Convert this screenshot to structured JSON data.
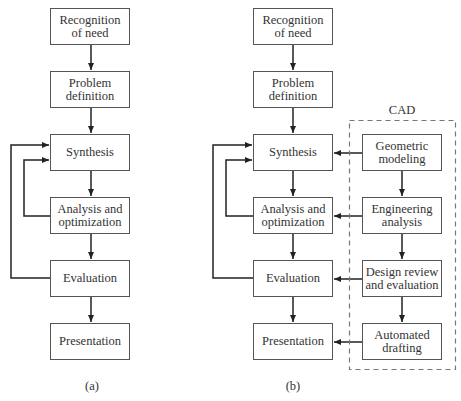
{
  "diagram_a": {
    "caption": "(a)",
    "steps": [
      {
        "id": "recognition",
        "label": "Recognition\nof need"
      },
      {
        "id": "problem",
        "label": "Problem\ndefinition"
      },
      {
        "id": "synthesis",
        "label": "Synthesis"
      },
      {
        "id": "analysis",
        "label": "Analysis and\noptimization"
      },
      {
        "id": "evaluation",
        "label": "Evaluation"
      },
      {
        "id": "presentation",
        "label": "Presentation"
      }
    ],
    "feedback_loops": [
      {
        "from": "analysis",
        "to": "synthesis"
      },
      {
        "from": "evaluation",
        "to": "synthesis"
      }
    ]
  },
  "diagram_b": {
    "caption": "(b)",
    "steps": [
      {
        "id": "recognition",
        "label": "Recognition\nof need"
      },
      {
        "id": "problem",
        "label": "Problem\ndefinition"
      },
      {
        "id": "synthesis",
        "label": "Synthesis"
      },
      {
        "id": "analysis",
        "label": "Analysis and\noptimization"
      },
      {
        "id": "evaluation",
        "label": "Evaluation"
      },
      {
        "id": "presentation",
        "label": "Presentation"
      }
    ],
    "cad_group_label": "CAD",
    "cad_steps": [
      {
        "id": "geometric",
        "label": "Geometric\nmodeling",
        "feeds": "synthesis"
      },
      {
        "id": "engineering",
        "label": "Engineering\nanalysis",
        "feeds": "analysis"
      },
      {
        "id": "design_review",
        "label": "Design review\nand evaluation",
        "feeds": "evaluation"
      },
      {
        "id": "drafting",
        "label": "Automated\ndrafting",
        "feeds": "presentation"
      }
    ],
    "feedback_loops": [
      {
        "from": "analysis",
        "to": "synthesis"
      },
      {
        "from": "evaluation",
        "to": "synthesis"
      }
    ]
  }
}
